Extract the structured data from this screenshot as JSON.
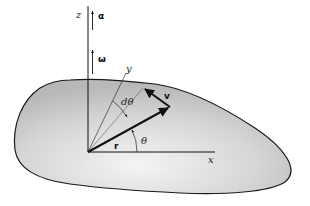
{
  "diagram": {
    "axes": {
      "x": "x",
      "y": "y",
      "z": "z"
    },
    "vectors": {
      "alpha": "α",
      "omega": "ω",
      "r": "r",
      "v": "v"
    },
    "angles": {
      "theta": "θ",
      "dtheta": "dθ"
    },
    "colors": {
      "body_fill_light": "#f2f2f2",
      "body_fill_dark": "#bdbdbd",
      "outline": "#1a1a1a"
    }
  }
}
